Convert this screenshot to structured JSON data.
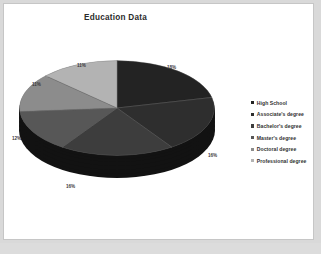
{
  "chart_data": {
    "type": "pie",
    "title": "Education Data",
    "xlabel": "",
    "ylabel": "",
    "legend_position": "right",
    "grid": false,
    "three_d": true,
    "categories": [
      "High School",
      "Associate's degree",
      "Bachelor's degree",
      "Master's degree",
      "Doctoral degree",
      "Professional degree"
    ],
    "values": [
      18,
      16,
      16,
      12,
      11,
      11
    ],
    "data_labels": [
      "18%",
      "16%",
      "16%",
      "12%",
      "11%",
      "11%"
    ],
    "slice_colors": [
      "#232323",
      "#2e2e2e",
      "#3d3d3d",
      "#575757",
      "#8c8c8c",
      "#b3b3b3"
    ]
  },
  "chart": {
    "title": "Education Data"
  },
  "legend": {
    "items": [
      {
        "label": "High School",
        "color": "#232323"
      },
      {
        "label": "Associate's degree",
        "color": "#2e2e2e"
      },
      {
        "label": "Bachelor's degree",
        "color": "#3d3d3d"
      },
      {
        "label": "Master's degree",
        "color": "#575757"
      },
      {
        "label": "Doctoral degree",
        "color": "#8c8c8c"
      },
      {
        "label": "Professional degree",
        "color": "#b3b3b3"
      }
    ]
  }
}
